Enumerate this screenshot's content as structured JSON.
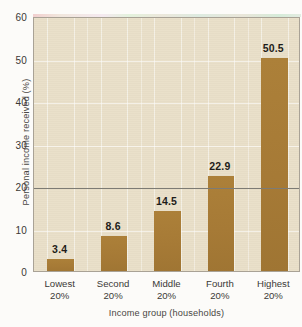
{
  "scan": {
    "top_cut_text": ""
  },
  "chart_data": {
    "type": "bar",
    "title": "",
    "categories": [
      "Lowest 20%",
      "Second 20%",
      "Middle 20%",
      "Fourth 20%",
      "Highest 20%"
    ],
    "category_lines": [
      [
        "Lowest",
        "20%"
      ],
      [
        "Second",
        "20%"
      ],
      [
        "Middle",
        "20%"
      ],
      [
        "Fourth",
        "20%"
      ],
      [
        "Highest",
        "20%"
      ]
    ],
    "values": [
      3.4,
      8.6,
      14.5,
      22.9,
      50.5
    ],
    "value_labels": [
      "3.4",
      "8.6",
      "14.5",
      "22.9",
      "50.5"
    ],
    "xlabel": "Income group (households)",
    "ylabel": "Personal income received (%)",
    "ylim": [
      0,
      60
    ],
    "yticks": [
      0,
      10,
      20,
      30,
      40,
      50,
      60
    ],
    "ytick_labels": [
      "0",
      "10",
      "20",
      "30",
      "40",
      "50",
      "60"
    ],
    "grid": true,
    "legend": "none",
    "reference_line": 20,
    "colors": {
      "bar": "#a87c38",
      "plot_background": "#e9dfc8",
      "grid": "#ffffff",
      "reference_line": "#7d7b74",
      "axis": "#a9a296",
      "text": "#3b3936",
      "page_background": "#fcfbf9"
    }
  }
}
